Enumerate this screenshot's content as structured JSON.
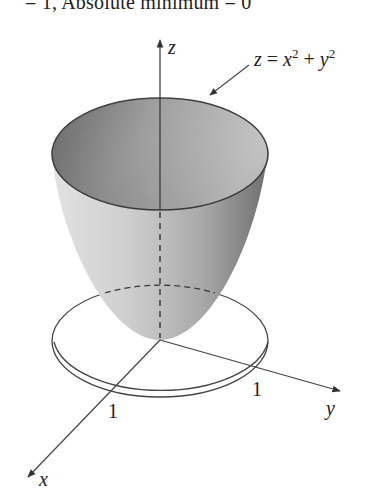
{
  "header": {
    "text": "= 1, Absolute minimum = 0"
  },
  "figure": {
    "surface_label": {
      "lhs": "z",
      "eq": " = ",
      "x": "x",
      "exp1": "2",
      "plus": " + ",
      "y": "y",
      "exp2": "2"
    },
    "axes": {
      "x_label": "x",
      "y_label": "y",
      "z_label": "z"
    },
    "ticks": {
      "x_tick": "1",
      "y_tick": "1"
    },
    "colors": {
      "line": "#3a3a3a",
      "surface_light": "#d8d8d8",
      "surface_dark": "#7a7a7a",
      "interior_dark": "#6e6e6e",
      "interior_light": "#bdbdbd"
    }
  }
}
